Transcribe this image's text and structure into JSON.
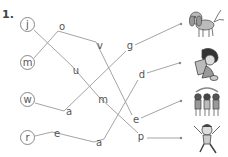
{
  "exercise": {
    "number": "1.",
    "start_letters": [
      {
        "id": "j",
        "label": "j",
        "x": 27,
        "y": 25
      },
      {
        "id": "m",
        "label": "m",
        "x": 27,
        "y": 63
      },
      {
        "id": "w",
        "label": "w",
        "x": 27,
        "y": 100
      },
      {
        "id": "r",
        "label": "r",
        "x": 27,
        "y": 138
      }
    ],
    "letters": [
      {
        "id": "o",
        "label": "o",
        "x": 62,
        "y": 27
      },
      {
        "id": "v",
        "label": "v",
        "x": 100,
        "y": 46
      },
      {
        "id": "u",
        "label": "u",
        "x": 76,
        "y": 71
      },
      {
        "id": "m2",
        "label": "m",
        "x": 103,
        "y": 100
      },
      {
        "id": "a1",
        "label": "a",
        "x": 69,
        "y": 112
      },
      {
        "id": "e1",
        "label": "e",
        "x": 57,
        "y": 135
      },
      {
        "id": "a2",
        "label": "a",
        "x": 99,
        "y": 143
      },
      {
        "id": "g",
        "label": "g",
        "x": 130,
        "y": 47
      },
      {
        "id": "d",
        "label": "d",
        "x": 142,
        "y": 76
      },
      {
        "id": "e2",
        "label": "e",
        "x": 136,
        "y": 120
      },
      {
        "id": "p",
        "label": "p",
        "x": 141,
        "y": 137
      }
    ],
    "words": [
      {
        "word": "jump",
        "path": [
          "j",
          "u",
          "m2",
          "p"
        ],
        "picture": "jumping-child"
      },
      {
        "word": "move",
        "path": [
          "m",
          "o",
          "v",
          "e2"
        ],
        "picture": "children-moving"
      },
      {
        "word": "wag",
        "path": [
          "w",
          "a1",
          "g"
        ],
        "picture": "dog-wagging"
      },
      {
        "word": "read",
        "path": [
          "r",
          "e1",
          "a2",
          "d"
        ],
        "picture": "child-reading"
      }
    ],
    "pictures": [
      {
        "name": "dog-wagging",
        "dot_x": 181,
        "dot_y": 24
      },
      {
        "name": "child-reading",
        "dot_x": 180,
        "dot_y": 63
      },
      {
        "name": "children-moving",
        "dot_x": 181,
        "dot_y": 101
      },
      {
        "name": "jumping-child",
        "dot_x": 181,
        "dot_y": 138
      }
    ],
    "colors": {
      "line": "#9a9a9a",
      "text": "#555555",
      "circle": "#888888"
    }
  }
}
